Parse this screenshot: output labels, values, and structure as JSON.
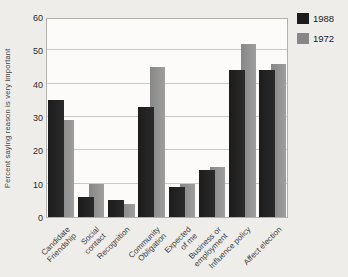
{
  "figure": {
    "background_color": "#efedea",
    "plot_background_color": "#fcfbfa"
  },
  "chart_data": {
    "type": "bar",
    "title": "",
    "xlabel": "",
    "ylabel": "Percent saying reason is very important",
    "ylim": [
      0,
      60
    ],
    "yticks": [
      0,
      10,
      20,
      30,
      40,
      50,
      60
    ],
    "grid": "horizontal",
    "legend_position": "top-right",
    "categories": [
      "Candidate Friendship",
      "Social contact",
      "Recognition",
      "Community Obligation",
      "Expected of me",
      "Business or employment",
      "Influence policy",
      "Affect election"
    ],
    "category_label_lines": [
      [
        "Candidate",
        "Friendship"
      ],
      [
        "Social",
        "contact"
      ],
      [
        "Recognition"
      ],
      [
        "Community",
        "Obligation"
      ],
      [
        "Expected",
        "of me"
      ],
      [
        "Business or",
        "employment"
      ],
      [
        "Influence policy"
      ],
      [
        "Affect election"
      ]
    ],
    "series": [
      {
        "name": "1988",
        "color": "#1c1c1c",
        "color_right": "#2a2a2a",
        "values": [
          35,
          6,
          5,
          33,
          9,
          14,
          44,
          44
        ]
      },
      {
        "name": "1972",
        "color": "#878787",
        "color_right": "#9e9e9e",
        "values": [
          29,
          10,
          4,
          45,
          10,
          15,
          52,
          46
        ]
      }
    ]
  }
}
